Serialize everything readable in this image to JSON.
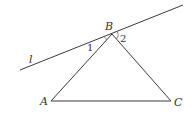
{
  "figure": {
    "points": {
      "A": "A",
      "B": "B",
      "C": "C"
    },
    "line_label": "l",
    "angles": {
      "angle1": "1",
      "angle2": "2"
    },
    "segments": [
      "AB",
      "BC",
      "AC"
    ],
    "colors": {
      "stroke": "#3a3a3a",
      "text": "#333333",
      "background": "#ffffff"
    }
  }
}
